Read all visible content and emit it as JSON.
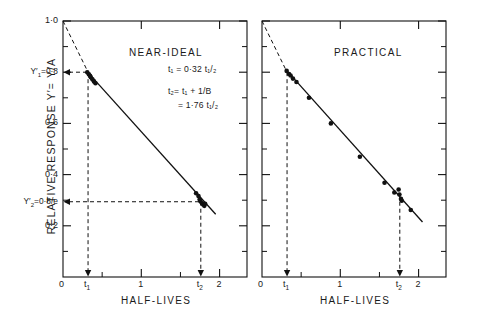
{
  "figure": {
    "ylabel": "RELATIVE  RESPONSE   Y′= Y/A",
    "panels": [
      {
        "title": "NEAR-IDEAL",
        "xlabel": "HALF-LIVES",
        "equations": [
          "t₁ = 0·32 t₁/₂",
          "t₂= t₁ + 1/B",
          "= 1·76 t₁/₂"
        ]
      },
      {
        "title": "PRACTICAL",
        "xlabel": "HALF-LIVES",
        "equations": []
      }
    ],
    "y_special": [
      {
        "id": "y1",
        "label": "Y′₁=0·8",
        "value": 0.8
      },
      {
        "id": "y2",
        "label": "Y′₂=0·8/e",
        "value": 0.294
      }
    ],
    "x_special": [
      {
        "id": "t1",
        "label": "t₁",
        "value": 0.32
      },
      {
        "id": "t2",
        "label": "t₂",
        "value": 1.76
      }
    ]
  },
  "chart_data": {
    "type": "scatter",
    "title": "",
    "xlabel": "HALF-LIVES",
    "ylabel": "RELATIVE RESPONSE Y′ = Y/A",
    "xlim": [
      0,
      2.35
    ],
    "ylim": [
      0,
      1.0
    ],
    "yscale": "log-like decay (linear axis)",
    "grid": false,
    "legend": null,
    "xticks": [
      0,
      1,
      2
    ],
    "xtick_labels": [
      "0",
      "1",
      "2"
    ],
    "yticks": [
      0.2,
      0.4,
      0.6,
      0.8,
      1.0
    ],
    "ytick_labels": [
      "0·2",
      "0·4",
      "0·6",
      "0·8",
      "1·0"
    ],
    "y_minor_ticks": [
      0.1,
      0.3,
      0.5,
      0.7,
      0.9
    ],
    "x_minor_ticks": [
      0.5,
      1.5
    ],
    "annotations": [
      {
        "text": "t₁ = 0·32 t₁/₂",
        "panel": 0
      },
      {
        "text": "t₂= t₁ + 1/B",
        "panel": 0
      },
      {
        "text": "= 1·76 t₁/₂",
        "panel": 0
      }
    ],
    "construction_lines": {
      "extrapolation": {
        "from": [
          0,
          1.0
        ],
        "to": [
          0.32,
          0.8
        ],
        "style": "dashed"
      },
      "y1_horizontal": {
        "y": 0.8,
        "from_x": 0,
        "to_x": 0.32,
        "style": "dashed"
      },
      "t1_vertical": {
        "x": 0.32,
        "from_y": 0.8,
        "to_y": 0,
        "style": "dashed",
        "arrow": "down"
      },
      "y2_horizontal": {
        "y": 0.294,
        "from_x": 0,
        "to_x": 1.76,
        "style": "dashed"
      },
      "t2_vertical": {
        "x": 1.76,
        "from_y": 0.294,
        "to_y": 0,
        "style": "dashed",
        "arrow": "down"
      }
    },
    "panels": [
      {
        "name": "NEAR-IDEAL",
        "fit_line": {
          "from": [
            0.3,
            0.805
          ],
          "to": [
            1.95,
            0.245
          ]
        },
        "points": [
          {
            "x": 0.31,
            "y": 0.8
          },
          {
            "x": 0.33,
            "y": 0.792
          },
          {
            "x": 0.345,
            "y": 0.786
          },
          {
            "x": 0.355,
            "y": 0.78
          },
          {
            "x": 0.375,
            "y": 0.772
          },
          {
            "x": 0.395,
            "y": 0.764
          },
          {
            "x": 0.415,
            "y": 0.757
          },
          {
            "x": 1.7,
            "y": 0.327
          },
          {
            "x": 1.73,
            "y": 0.316
          },
          {
            "x": 1.745,
            "y": 0.303
          },
          {
            "x": 1.755,
            "y": 0.296
          },
          {
            "x": 1.775,
            "y": 0.288
          },
          {
            "x": 1.79,
            "y": 0.283
          },
          {
            "x": 1.805,
            "y": 0.278
          },
          {
            "x": 1.815,
            "y": 0.286
          }
        ]
      },
      {
        "name": "PRACTICAL",
        "fit_line": {
          "from": [
            0.3,
            0.812
          ],
          "to": [
            2.05,
            0.215
          ]
        },
        "points": [
          {
            "x": 0.315,
            "y": 0.805
          },
          {
            "x": 0.345,
            "y": 0.793
          },
          {
            "x": 0.365,
            "y": 0.787
          },
          {
            "x": 0.395,
            "y": 0.775
          },
          {
            "x": 0.44,
            "y": 0.762
          },
          {
            "x": 0.6,
            "y": 0.7
          },
          {
            "x": 0.88,
            "y": 0.6
          },
          {
            "x": 1.25,
            "y": 0.47
          },
          {
            "x": 1.565,
            "y": 0.368
          },
          {
            "x": 1.69,
            "y": 0.33
          },
          {
            "x": 1.745,
            "y": 0.342
          },
          {
            "x": 1.755,
            "y": 0.322
          },
          {
            "x": 1.775,
            "y": 0.305
          },
          {
            "x": 1.785,
            "y": 0.298
          },
          {
            "x": 1.9,
            "y": 0.262
          }
        ]
      }
    ]
  }
}
